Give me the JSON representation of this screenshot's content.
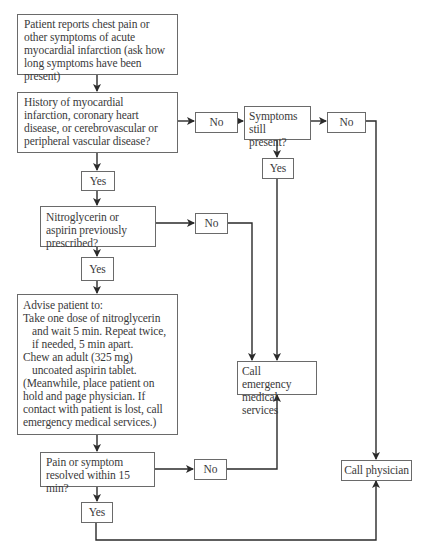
{
  "flowchart": {
    "start": {
      "text": "Patient reports chest pain or other symptoms of acute myocardial infarction (ask how long symptoms have been present)"
    },
    "history_question": {
      "text": "History of myocardial infarction, coronary heart disease, or cerebrovascular or peripheral vascular disease?"
    },
    "history_no": "No",
    "history_yes": "Yes",
    "symptoms_present_question": {
      "text": "Symptoms still present?"
    },
    "symptoms_no": "No",
    "symptoms_yes": "Yes",
    "prescribed_question": {
      "text": "Nitroglycerin or aspirin previously prescribed?"
    },
    "prescribed_no": "No",
    "prescribed_yes": "Yes",
    "advise": {
      "title": "Advise patient to:",
      "step1": "Take one dose of nitroglycerin and wait 5 min. Repeat twice, if needed, 5 min apart.",
      "step2": "Chew an adult (325 mg) uncoated aspirin tablet.",
      "note": "(Meanwhile, place patient on hold and page physician. If contact with patient is lost, call emergency medical services.)"
    },
    "resolved_question": {
      "text": "Pain or symptom resolved within 15 min?"
    },
    "resolved_no": "No",
    "resolved_yes": "Yes",
    "call_ems": {
      "text": "Call emergency medical services"
    },
    "call_physician": {
      "text": "Call physician"
    }
  },
  "colors": {
    "line": "#2a2a2a",
    "border": "#6a6a6a",
    "text": "#3a3a3a",
    "background": "#ffffff"
  }
}
